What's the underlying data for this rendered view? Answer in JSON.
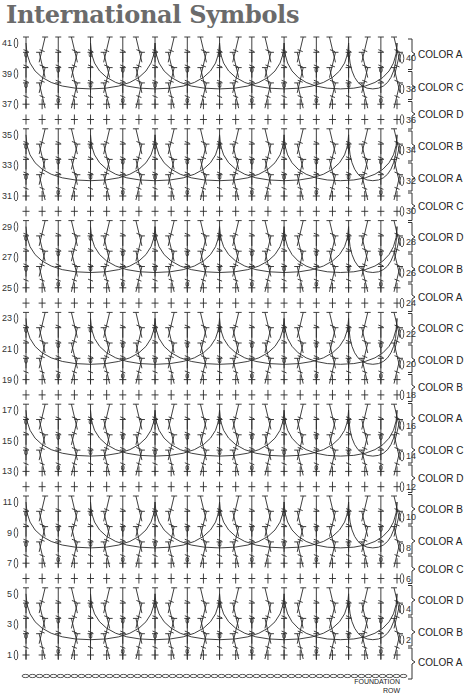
{
  "title": "International Symbols",
  "chart": {
    "left_rows": [
      "41",
      "39",
      "37",
      "35",
      "33",
      "31",
      "29",
      "27",
      "25",
      "23",
      "21",
      "19",
      "17",
      "15",
      "13",
      "11",
      "9",
      "7",
      "5",
      "3",
      "1"
    ],
    "right_rows": [
      "40",
      "38",
      "36",
      "34",
      "32",
      "30",
      "28",
      "26",
      "24",
      "22",
      "20",
      "18",
      "16",
      "14",
      "12",
      "10",
      "8",
      "6",
      "4",
      "2"
    ],
    "color_groups": [
      {
        "label": "COLOR A",
        "y": 54
      },
      {
        "label": "COLOR C",
        "y": 87
      },
      {
        "label": "COLOR D",
        "y": 114
      },
      {
        "label": "COLOR B",
        "y": 146
      },
      {
        "label": "COLOR A",
        "y": 178
      },
      {
        "label": "COLOR C",
        "y": 206
      },
      {
        "label": "COLOR D",
        "y": 237
      },
      {
        "label": "COLOR B",
        "y": 269
      },
      {
        "label": "COLOR A",
        "y": 297
      },
      {
        "label": "COLOR C",
        "y": 328
      },
      {
        "label": "COLOR D",
        "y": 360
      },
      {
        "label": "COLOR B",
        "y": 387
      },
      {
        "label": "COLOR A",
        "y": 418
      },
      {
        "label": "COLOR C",
        "y": 450
      },
      {
        "label": "COLOR D",
        "y": 478
      },
      {
        "label": "COLOR B",
        "y": 509
      },
      {
        "label": "COLOR A",
        "y": 541
      },
      {
        "label": "COLOR C",
        "y": 569
      },
      {
        "label": "COLOR D",
        "y": 600
      },
      {
        "label": "COLOR B",
        "y": 632
      },
      {
        "label": "COLOR A",
        "y": 662
      }
    ],
    "foundation_label_line1": "FOUNDATION",
    "foundation_label_line2": "ROW",
    "stitch_color": "#2a2a2a",
    "total_rows": 41,
    "repeat_count": 6
  }
}
